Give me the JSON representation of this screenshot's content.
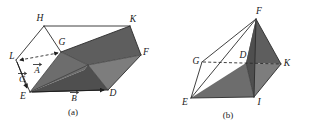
{
  "figure": {
    "background_color": "#ffffff",
    "line_color": "#2b2b2b",
    "shade_color": "#6d6d6d"
  },
  "panel_a": {
    "caption": "(a)",
    "vertices": [
      {
        "label": "H",
        "x": 40,
        "y": 21
      },
      {
        "label": "K",
        "x": 133,
        "y": 22
      },
      {
        "label": "G",
        "x": 62,
        "y": 45
      },
      {
        "label": "F",
        "x": 146,
        "y": 55
      },
      {
        "label": "L",
        "x": 12,
        "y": 57
      },
      {
        "label": "A",
        "x": 37,
        "y": 70
      },
      {
        "label": "C",
        "x": 22,
        "y": 79
      },
      {
        "label": "E",
        "x": 23,
        "y": 97
      },
      {
        "label": "B",
        "x": 74,
        "y": 98
      },
      {
        "label": "D",
        "x": 113,
        "y": 95
      }
    ],
    "vectors": [
      {
        "label": "A",
        "from": "L",
        "to": "G",
        "style": "dashed",
        "arrow": "both"
      },
      {
        "label": "B",
        "from": "E",
        "to": "D",
        "style": "solid",
        "arrow": "end"
      },
      {
        "label": "C",
        "from": "L",
        "to": "E",
        "style": "solid",
        "arrow": "end"
      }
    ],
    "vector_labels": [
      "A",
      "B",
      "C"
    ]
  },
  "panel_b": {
    "caption": "(b)",
    "vertices": [
      {
        "label": "F",
        "x": 259,
        "y": 13
      },
      {
        "label": "G",
        "x": 198,
        "y": 61
      },
      {
        "label": "D",
        "x": 242,
        "y": 57
      },
      {
        "label": "K",
        "x": 286,
        "y": 63
      },
      {
        "label": "E",
        "x": 185,
        "y": 101
      },
      {
        "label": "I",
        "x": 259,
        "y": 100
      }
    ],
    "hidden_edges": [
      {
        "from": "G",
        "to": "K",
        "style": "dashed"
      }
    ]
  }
}
